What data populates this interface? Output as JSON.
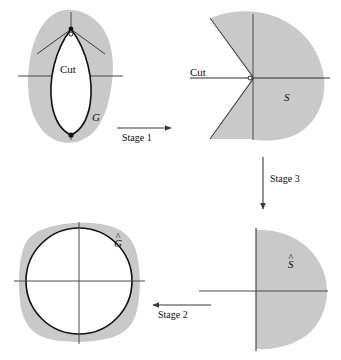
{
  "figure": {
    "background_color": "#ffffff",
    "shade_color": "#c9c9c9",
    "outline_color": "#111111",
    "axis_color": "#4a4a4a",
    "arrow_color": "#3a3a3a",
    "panels": [
      {
        "id": "panel-g",
        "name": "region-G",
        "set_label": "G",
        "cut_label": "Cut",
        "description": "shaded blob with white lens-shaped slit and cut"
      },
      {
        "id": "panel-s",
        "name": "region-S",
        "set_label": "S",
        "cut_label": "Cut",
        "description": "shaded region with wedge notch removed at origin"
      },
      {
        "id": "panel-ghat",
        "name": "region-G-hat",
        "set_label": "G",
        "set_label_accent": "^",
        "description": "shaded rounded square with white disk"
      },
      {
        "id": "panel-shat",
        "name": "region-S-hat",
        "set_label": "S",
        "set_label_accent": "^",
        "description": "shaded right half-plane style region"
      }
    ],
    "arrows": [
      {
        "id": "stage-1",
        "label": "Stage 1",
        "direction": "right"
      },
      {
        "id": "stage-3",
        "label": "Stage 3",
        "direction": "down"
      },
      {
        "id": "stage-2",
        "label": "Stage 2",
        "direction": "left"
      }
    ]
  }
}
